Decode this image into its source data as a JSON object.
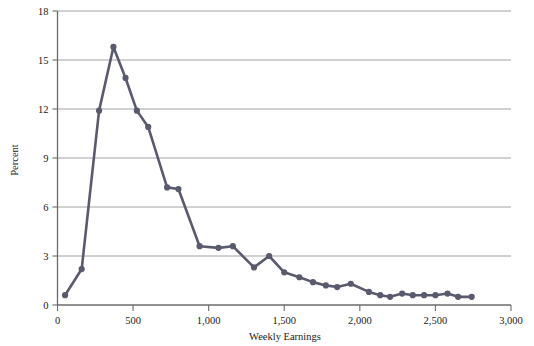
{
  "chart_data": {
    "type": "line",
    "title": "",
    "subtitle": "",
    "xlabel": "Weekly Earnings",
    "ylabel": "Percent",
    "xlim": [
      0,
      3000
    ],
    "ylim": [
      0,
      18
    ],
    "xticks": [
      0,
      500,
      1000,
      1500,
      2000,
      2500,
      3000
    ],
    "xtick_labels": [
      "0",
      "500",
      "1,000",
      "1,500",
      "2,000",
      "2,500",
      "3,000"
    ],
    "yticks": [
      0,
      3,
      6,
      9,
      12,
      15,
      18
    ],
    "ytick_labels": [
      "0",
      "3",
      "6",
      "9",
      "12",
      "15",
      "18"
    ],
    "grid": "horizontal",
    "legend": null,
    "series": [
      {
        "name": "Percent of workers",
        "marker": "circle",
        "color": "#5a5a6e",
        "x": [
          50,
          160,
          275,
          370,
          450,
          525,
          600,
          725,
          800,
          940,
          1065,
          1160,
          1300,
          1400,
          1500,
          1600,
          1690,
          1775,
          1850,
          1940,
          2060,
          2135,
          2200,
          2280,
          2350,
          2425,
          2500,
          2580,
          2650,
          2740
        ],
        "y": [
          0.6,
          2.2,
          11.9,
          15.8,
          13.9,
          11.9,
          10.9,
          7.2,
          7.1,
          3.6,
          3.5,
          3.6,
          2.3,
          3.0,
          2.0,
          1.7,
          1.4,
          1.2,
          1.1,
          1.3,
          0.8,
          0.6,
          0.5,
          0.7,
          0.6,
          0.6,
          0.6,
          0.7,
          0.5,
          0.5
        ]
      }
    ]
  },
  "colors": {
    "line": "#5a5a6e",
    "grid": "#8c8c8c",
    "axis": "#6b6b6b",
    "text": "#1a1a1a",
    "background": "#ffffff"
  }
}
